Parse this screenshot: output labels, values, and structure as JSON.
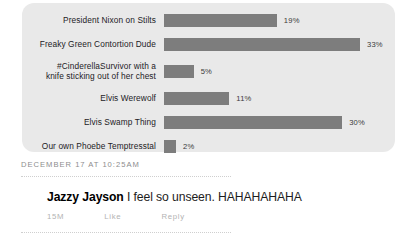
{
  "chart_data": {
    "type": "bar",
    "orientation": "horizontal",
    "title": "",
    "xlabel": "",
    "ylabel": "",
    "xlim": [
      0,
      33
    ],
    "grid": false,
    "legend": null,
    "value_suffix": "%",
    "categories": [
      "President Nixon on Stilts",
      "Freaky Green Contortion Dude",
      "#CinderellaSurvivor with a\nknife sticking out of her chest",
      "Elvis Werewolf",
      "Elvis Swamp Thing",
      "Our own Phoebe Temptresstal"
    ],
    "values": [
      19,
      33,
      5,
      11,
      30,
      2
    ],
    "value_labels": [
      "19%",
      "33%",
      "5%",
      "11%",
      "30%",
      "2%"
    ],
    "bar_color": "#7d7d7d",
    "panel_color": "#e9e9e9"
  },
  "post": {
    "timestamp": "DECEMBER 17 AT 10:25AM"
  },
  "comment": {
    "author": "Jazzy Jayson",
    "text": " I feel so unseen. HAHAHAHAHA",
    "actions": [
      {
        "label": "15M"
      },
      {
        "label": "Like"
      },
      {
        "label": "Reply"
      }
    ]
  }
}
